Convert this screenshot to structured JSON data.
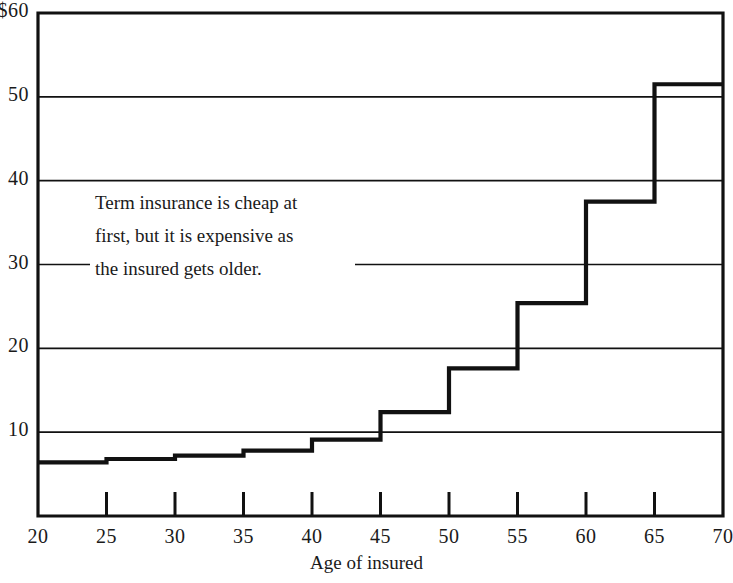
{
  "chart_data": {
    "type": "line",
    "title": "",
    "subtitle": "",
    "xlabel": "Age of insured",
    "ylabel": "",
    "xlim": [
      20,
      70
    ],
    "ylim": [
      0,
      60
    ],
    "grid": true,
    "legend": false,
    "step_style": "post",
    "x_ticks": [
      20,
      25,
      30,
      35,
      40,
      45,
      50,
      55,
      60,
      65,
      70
    ],
    "x_tick_labels": [
      "20",
      "25",
      "30",
      "35",
      "40",
      "45",
      "50",
      "55",
      "60",
      "65",
      "70"
    ],
    "y_ticks": [
      10,
      20,
      30,
      40,
      50,
      60
    ],
    "y_tick_labels": [
      "10",
      "20",
      "30",
      "40",
      "50",
      "$60"
    ],
    "series": [
      {
        "name": "Term insurance premium",
        "x": [
          20,
          25,
          30,
          35,
          40,
          45,
          50,
          55,
          60,
          65,
          70
        ],
        "values": [
          6.4,
          6.8,
          7.2,
          7.8,
          9.1,
          12.4,
          17.6,
          25.4,
          37.5,
          51.5,
          51.5
        ]
      }
    ],
    "annotations": [
      {
        "text": "Term insurance is cheap at first, but it is expensive as the insured gets older.",
        "lines": [
          "Term insurance is cheap at",
          "first, but it is expensive as",
          "the insured gets older."
        ]
      }
    ],
    "colors": {
      "line": "#111111",
      "grid": "#111111",
      "axis": "#111111",
      "background": "#ffffff",
      "text": "#1a1a1a"
    }
  },
  "axis": {
    "x_title": "Age of insured"
  }
}
